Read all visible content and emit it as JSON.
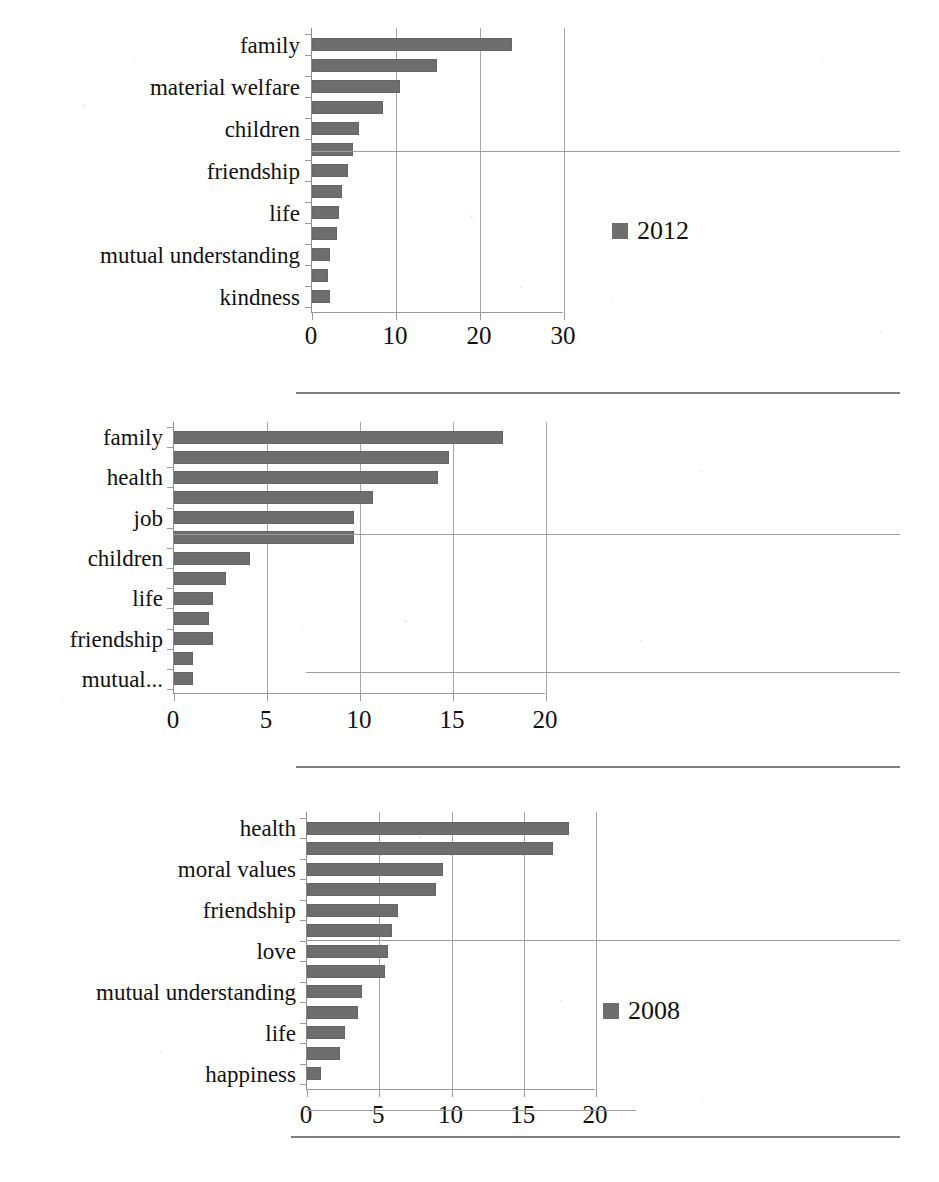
{
  "figure": {
    "background": "#ffffff",
    "bar_color": "#6e6e6e",
    "axis_color": "#9a9a9a",
    "grid_color": "#a6a6a6"
  },
  "chart_data": [
    {
      "id": "chart-2012",
      "type": "bar",
      "orientation": "horizontal",
      "title": "",
      "legend": {
        "entries": [
          "2012"
        ],
        "position": "right"
      },
      "xlabel": "",
      "ylabel": "",
      "xlim": [
        0,
        30
      ],
      "xticks": [
        0,
        10,
        20,
        30
      ],
      "xtick_labels": [
        "0",
        "10",
        "20",
        "30"
      ],
      "grid": true,
      "categories": [
        "family",
        "",
        "material welfare",
        "",
        "children",
        "",
        "friendship",
        "",
        "life",
        "",
        "mutual understanding",
        "",
        "kindness"
      ],
      "visible_category_labels": [
        "family",
        "material welfare",
        "children",
        "friendship",
        "life",
        "mutual understanding",
        "kindness"
      ],
      "values": [
        23.8,
        14.9,
        10.5,
        8.4,
        5.6,
        4.9,
        4.3,
        3.6,
        3.2,
        3.0,
        2.1,
        1.9,
        2.1
      ]
    },
    {
      "id": "chart-2008",
      "type": "bar",
      "orientation": "horizontal",
      "title": "",
      "legend": {
        "entries": [
          "2008"
        ],
        "position": "right"
      },
      "xlabel": "",
      "ylabel": "",
      "xlim": [
        0,
        20
      ],
      "xticks": [
        0,
        5,
        10,
        15,
        20
      ],
      "xtick_labels": [
        "0",
        "5",
        "10",
        "15",
        "20"
      ],
      "grid": true,
      "categories": [
        "family",
        "",
        "health",
        "",
        "job",
        "",
        "children",
        "",
        "life",
        "",
        "friendship",
        "",
        "mutual..."
      ],
      "visible_category_labels": [
        "family",
        "health",
        "job",
        "children",
        "life",
        "friendship",
        "mutual..."
      ],
      "values": [
        17.7,
        14.8,
        14.2,
        10.7,
        9.7,
        9.7,
        4.1,
        2.8,
        2.1,
        1.9,
        2.1,
        1.0,
        1.0
      ]
    },
    {
      "id": "chart-2004",
      "type": "bar",
      "orientation": "horizontal",
      "title": "",
      "legend": {
        "entries": [
          "2004"
        ],
        "position": "right"
      },
      "xlabel": "",
      "ylabel": "",
      "xlim": [
        0,
        20
      ],
      "xticks": [
        0,
        5,
        10,
        15,
        20
      ],
      "xtick_labels": [
        "0",
        "5",
        "10",
        "15",
        "20"
      ],
      "grid": true,
      "categories": [
        "health",
        "",
        "moral values",
        "",
        "friendship",
        "",
        "love",
        "",
        "mutual understanding",
        "",
        "life",
        "",
        "happiness"
      ],
      "visible_category_labels": [
        "health",
        "moral values",
        "friendship",
        "love",
        "mutual understanding",
        "life",
        "happiness"
      ],
      "values": [
        18.1,
        17.0,
        9.4,
        8.9,
        6.3,
        5.9,
        5.6,
        5.4,
        3.8,
        3.5,
        2.6,
        2.3,
        1.0
      ]
    }
  ]
}
